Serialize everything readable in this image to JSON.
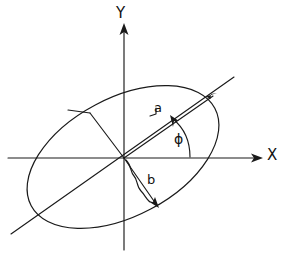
{
  "figure": {
    "type": "geometry-diagram",
    "background_color": "#ffffff",
    "stroke_color": "#1a1a1a"
  },
  "axes": {
    "x_label": "X",
    "y_label": "Y",
    "origin": {
      "x": 124,
      "y": 158
    },
    "x_axis": {
      "x1": 8,
      "y1": 158,
      "x2": 262,
      "y2": 158,
      "arrow": "right"
    },
    "y_axis": {
      "x1": 124,
      "y1": 248,
      "x2": 124,
      "y2": 24,
      "arrow": "up"
    }
  },
  "ellipse": {
    "center_x": 123,
    "center_y": 157,
    "semi_major": 104,
    "semi_minor": 59,
    "rotation_deg": 28
  },
  "annotations": {
    "semi_major_label": "a",
    "semi_minor_label": "b",
    "angle_label": "ϕ"
  },
  "labels": {
    "y": "Y",
    "x": "X",
    "a": "a",
    "b": "b",
    "phi": "ϕ"
  }
}
